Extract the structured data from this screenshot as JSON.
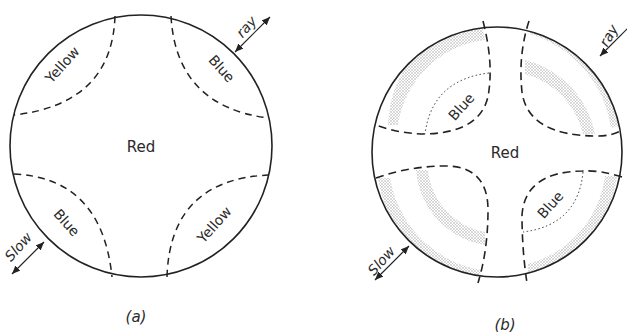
{
  "figure": {
    "panels": [
      {
        "id": "a",
        "caption": "(a)",
        "center_label": "Red",
        "quadrant_labels": {
          "top_left": "Yellow",
          "top_right": "Blue",
          "bottom_left": "Blue",
          "bottom_right": "Yellow"
        },
        "arrows": {
          "ne": "ray",
          "sw": "Slow"
        }
      },
      {
        "id": "b",
        "caption": "(b)",
        "center_label": "Red",
        "quadrant_labels": {
          "top_left": "Blue",
          "bottom_right": "Blue"
        },
        "arrows": {
          "ne": "ray",
          "sw": "Slow"
        }
      }
    ]
  }
}
